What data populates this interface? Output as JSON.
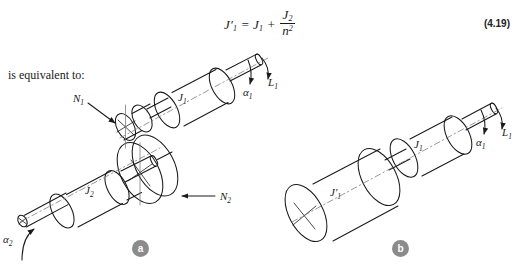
{
  "figure": {
    "caption_text": "is equivalent to:",
    "equation": {
      "number": "(4.19)",
      "lhs": "J",
      "lhs_prime": "′",
      "lhs_sub": "1",
      "eq_sign": "=",
      "rhs_first": "J",
      "rhs_first_sub": "1",
      "plus": "+",
      "frac_num": "J",
      "frac_num_sub": "2",
      "frac_den": "n",
      "frac_den_sup": "2",
      "plain": "J'1 = J1 + J2/n^2"
    },
    "panels": [
      {
        "id": "a",
        "badge": "a",
        "labels": {
          "inertia_1": "J",
          "inertia_1_sub": "1",
          "inertia_2": "J",
          "inertia_2_sub": "2",
          "gear_small": "N",
          "gear_small_sub": "1",
          "gear_large": "N",
          "gear_large_sub": "2",
          "alpha_1": "α",
          "alpha_1_sub": "1",
          "alpha_2": "α",
          "alpha_2_sub": "2",
          "torque_1": "L",
          "torque_1_sub": "1"
        }
      },
      {
        "id": "b",
        "badge": "b",
        "labels": {
          "inertia_equiv": "J",
          "inertia_equiv_prime": "′",
          "inertia_equiv_sub": "1",
          "inertia_1": "J",
          "inertia_1_sub": "1",
          "alpha_1": "α",
          "alpha_1_sub": "1",
          "torque_1": "L",
          "torque_1_sub": "1"
        }
      }
    ],
    "colors": {
      "ink": "#1a1a1a",
      "badge_fill": "#8b8b8b",
      "badge_text": "#ffffff",
      "background": "#ffffff",
      "centerline": "#777777"
    }
  }
}
